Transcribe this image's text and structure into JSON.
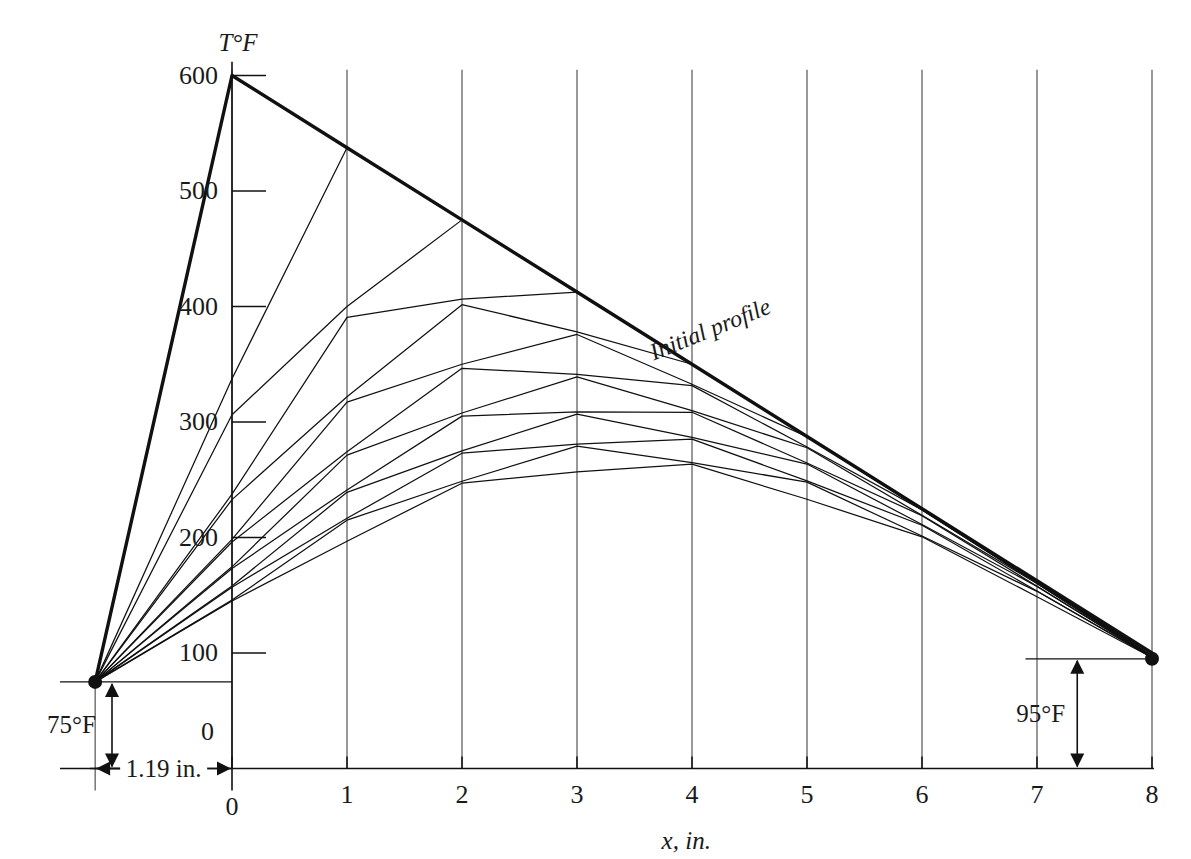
{
  "figure": {
    "kind": "schmidt-graphical-transient-conduction-plot",
    "y_axis_title": "T°F",
    "x_axis_title": "x, in.",
    "curve_label": "Initial profile",
    "left_dim_label": "75°F",
    "right_dim_label": "95°F",
    "width_dim_label": "1.19 in.",
    "origin_label": "0",
    "line_color": "#111111",
    "grid_color": "#444444",
    "text_color": "#1a1a1a"
  },
  "chart_data": {
    "type": "line",
    "title": "",
    "subtitle": "",
    "xlabel": "x, in.",
    "ylabel": "T°F",
    "xlim": [
      -1.19,
      8
    ],
    "ylim": [
      0,
      620
    ],
    "grid": "vertical gridlines at each integer x from 0 to 8",
    "legend": "none (single annotated curve: Initial profile)",
    "x_ticks": [
      0,
      1,
      2,
      3,
      4,
      5,
      6,
      7,
      8
    ],
    "x_tick_labels": [
      "0",
      "1",
      "2",
      "3",
      "4",
      "5",
      "6",
      "7",
      "8"
    ],
    "y_ticks": [
      0,
      100,
      200,
      300,
      400,
      500,
      600
    ],
    "y_tick_labels": [
      "0",
      "100",
      "200",
      "300",
      "400",
      "500",
      "600"
    ],
    "x": [
      -1.19,
      0,
      1,
      2,
      3,
      4,
      5,
      6,
      7,
      8
    ],
    "boundary": {
      "left_surface_x": -1.19,
      "left_surface_T": 75,
      "right_surface_x": 8,
      "right_surface_T": 95
    },
    "annotations": [
      {
        "text": "Initial profile",
        "x": 3.6,
        "y": 370,
        "rotation_deg": -22
      },
      {
        "text": "75°F",
        "x": -1.19,
        "y": 37,
        "kind": "dimension"
      },
      {
        "text": "95°F",
        "x": 7.4,
        "y": 47,
        "kind": "dimension"
      },
      {
        "text": "1.19 in.",
        "x": -0.6,
        "y": 0,
        "kind": "dimension"
      }
    ],
    "series": [
      {
        "name": "Initial profile",
        "emphasis": "thick",
        "values": [
          75,
          600,
          537.5,
          475,
          412.5,
          350,
          287.5,
          225,
          162.5,
          100
        ]
      },
      {
        "name": "Profile 1",
        "values": [
          75,
          337.5,
          537.5,
          475,
          412.5,
          350,
          287.5,
          225,
          162.5,
          97.5
        ]
      },
      {
        "name": "Profile 2",
        "values": [
          75,
          306.25,
          400.0,
          475,
          412.5,
          350,
          287.5,
          225,
          161.25,
          97.5
        ]
      },
      {
        "name": "Profile 3",
        "values": [
          75,
          237.5,
          390.6,
          406.3,
          412.5,
          350,
          287.5,
          224.4,
          161.25,
          96.9
        ]
      },
      {
        "name": "Profile 4",
        "values": [
          75,
          232.8,
          321.9,
          401.6,
          378.1,
          350,
          287.2,
          224.4,
          160.6,
          96.9
        ]
      },
      {
        "name": "Profile 5",
        "values": [
          75,
          198.4,
          317.2,
          350.0,
          375.8,
          332.7,
          287.2,
          223.9,
          160.6,
          96.6
        ]
      },
      {
        "name": "Profile 6",
        "values": [
          75,
          196.1,
          274.2,
          346.5,
          341.3,
          331.5,
          278.3,
          223.9,
          160.2,
          96.6
        ]
      },
      {
        "name": "Profile 7",
        "values": [
          75,
          174.6,
          271.3,
          307.8,
          339.0,
          309.8,
          277.7,
          219.2,
          160.2,
          96.4
        ]
      },
      {
        "name": "Profile 8",
        "values": [
          75,
          173.1,
          241.2,
          305.1,
          308.8,
          308.4,
          264.5,
          218.9,
          157.8,
          96.4
        ]
      },
      {
        "name": "Profile 9",
        "values": [
          75,
          158.1,
          239.1,
          275.0,
          306.8,
          286.7,
          263.6,
          211.2,
          157.7,
          96.2
        ]
      },
      {
        "name": "Profile 10",
        "values": [
          75,
          157.0,
          216.6,
          273.0,
          280.8,
          285.2,
          249.0,
          210.6,
          153.7,
          96.2
        ]
      },
      {
        "name": "Profile 11",
        "values": [
          75,
          145.8,
          215.0,
          248.7,
          279.1,
          264.9,
          247.9,
          201.3,
          153.4,
          96.1
        ]
      },
      {
        "name": "Profile 12",
        "values": [
          75,
          145.0,
          196.8,
          247.0,
          256.8,
          263.5,
          233.1,
          200.6,
          148.7,
          96.1
        ]
      }
    ]
  }
}
